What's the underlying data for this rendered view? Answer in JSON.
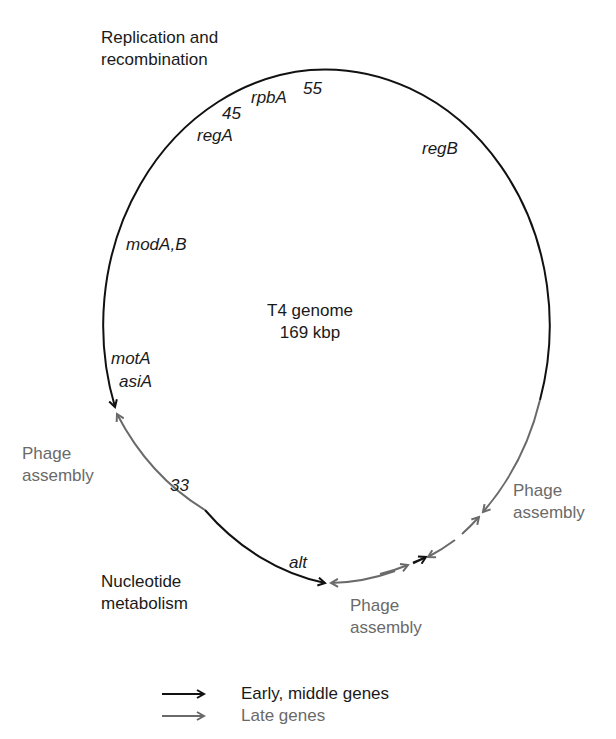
{
  "title": {
    "line1": "T4 genome",
    "line2": "169 kbp"
  },
  "regions": {
    "replication": {
      "line1": "Replication and",
      "line2": "recombination"
    },
    "phage_left": {
      "line1": "Phage",
      "line2": "assembly"
    },
    "phage_right": {
      "line1": "Phage",
      "line2": "assembly"
    },
    "phage_bottom": {
      "line1": "Phage",
      "line2": "assembly"
    },
    "nucleotide": {
      "line1": "Nucleotide",
      "line2": "metabolism"
    }
  },
  "genes": {
    "g55": "55",
    "rpbA": "rpbA",
    "g45": "45",
    "regA": "regA",
    "regB": "regB",
    "modAB": "modA,B",
    "motA": "motA",
    "asiA": "asiA",
    "g33": "33",
    "alt": "alt"
  },
  "legend": {
    "items": [
      {
        "label": "Early, middle genes",
        "color": "#111111"
      },
      {
        "label": "Late genes",
        "color": "#6a6a6a"
      }
    ]
  },
  "colors": {
    "early": "#111111",
    "late": "#6a6a6a"
  }
}
